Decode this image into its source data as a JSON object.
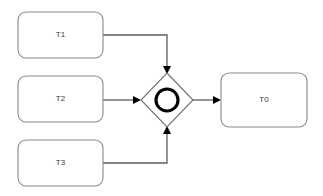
{
  "diagram": {
    "type": "bpmn-flow-diagram",
    "background_color": "#ffffff",
    "canvas": {
      "width": 323,
      "height": 196
    },
    "colors": {
      "task_stroke": "#8a8a8a",
      "task_fill": "#ffffff",
      "gateway_stroke": "#6f6f6f",
      "gateway_circle_stroke": "#000000",
      "flow_stroke": "#5e5e5e",
      "arrowhead_fill": "#000000",
      "label_text": "#3a3a3a"
    },
    "tasks": [
      {
        "id": "t1",
        "label": "T1",
        "shape": "rounded-rectangle",
        "x": 18,
        "y": 12,
        "width": 85,
        "height": 46,
        "rx": 8,
        "label_x": 60.5,
        "label_y": 35
      },
      {
        "id": "t2",
        "label": "T2",
        "shape": "rounded-rectangle",
        "x": 18,
        "y": 76,
        "width": 85,
        "height": 46,
        "rx": 8,
        "label_x": 60.5,
        "label_y": 99
      },
      {
        "id": "t3",
        "label": "T3",
        "shape": "rounded-rectangle",
        "x": 18,
        "y": 140,
        "width": 85,
        "height": 46,
        "rx": 8,
        "label_x": 60.5,
        "label_y": 163
      },
      {
        "id": "t0",
        "label": "T0",
        "shape": "rounded-rectangle",
        "x": 221,
        "y": 73,
        "width": 86,
        "height": 54,
        "rx": 8,
        "label_x": 264,
        "label_y": 100
      }
    ],
    "gateway": {
      "id": "gateway-1",
      "kind": "event-based-gateway",
      "shape": "diamond-with-circle",
      "center_x": 167,
      "center_y": 100,
      "half_width": 26,
      "half_height": 27,
      "circle_radius": 11,
      "label": ""
    },
    "flows": [
      {
        "id": "flow-t1-gateway",
        "from": "t1",
        "to": "gateway-1",
        "routing": "orthogonal",
        "arrow_direction": "down",
        "path": "M 103 35 L 167 35 L 167 68",
        "head": "167,74 163,66 171,66"
      },
      {
        "id": "flow-t2-gateway",
        "from": "t2",
        "to": "gateway-1",
        "routing": "straight",
        "arrow_direction": "right",
        "path": "M 103 100 L 134 100",
        "head": "141,100 133,96 133,104"
      },
      {
        "id": "flow-t3-gateway",
        "from": "t3",
        "to": "gateway-1",
        "routing": "orthogonal",
        "arrow_direction": "up",
        "path": "M 103 163 L 167 163 L 167 132",
        "head": "167,126 163,134 171,134"
      },
      {
        "id": "flow-gateway-t0",
        "from": "gateway-1",
        "to": "t0",
        "routing": "straight",
        "arrow_direction": "right",
        "path": "M 193 100 L 214 100",
        "head": "221,100 213,96 213,104"
      }
    ]
  }
}
